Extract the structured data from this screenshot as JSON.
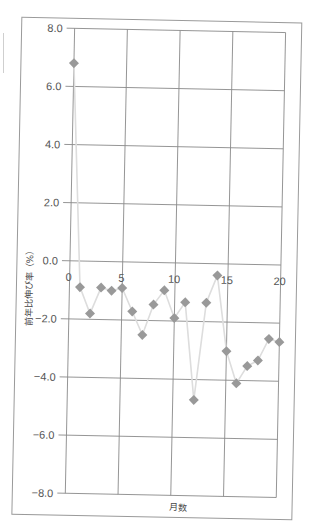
{
  "chart_data": {
    "type": "line",
    "title": "",
    "xlabel": "月数",
    "ylabel": "前年比伸び率（%）",
    "x": [
      0,
      1,
      2,
      3,
      4,
      5,
      6,
      7,
      8,
      9,
      10,
      11,
      12,
      13,
      14,
      15,
      16,
      17,
      18,
      19,
      20
    ],
    "series": [
      {
        "name": "前年比伸び率",
        "values": [
          6.8,
          -0.9,
          -1.8,
          -0.9,
          -1.0,
          -0.9,
          -1.7,
          -2.5,
          -1.45,
          -0.95,
          -1.9,
          -1.35,
          -4.7,
          -1.35,
          -0.4,
          -3.0,
          -4.1,
          -3.5,
          -3.3,
          -2.55,
          -2.65
        ],
        "marker": "diamond",
        "marker_color": "#999999",
        "line_color": "#dddddd"
      }
    ],
    "xlim": [
      0,
      20
    ],
    "ylim": [
      -8.0,
      8.0
    ],
    "x_ticks": [
      "0",
      "5",
      "10",
      "15",
      "20"
    ],
    "y_ticks": [
      "8.0",
      "6.0",
      "4.0",
      "2.0",
      "0.0",
      "−2.0",
      "−4.0",
      "−6.0",
      "−8.0"
    ],
    "grid": true,
    "legend": "none"
  },
  "labels": {
    "xlabel": "月数",
    "ylabel": "前年比伸び率（%）"
  },
  "colors": {
    "grid": "#8a8a8a",
    "frame": "#9a9a9a",
    "marker": "#999999",
    "line": "#dddddd"
  }
}
